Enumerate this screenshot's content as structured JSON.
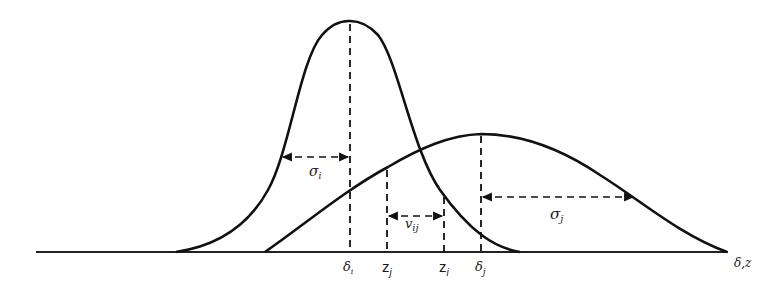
{
  "diagram": {
    "axis_label": "δ,z",
    "curves": [
      {
        "name": "distribution-i",
        "mean_label": "δ",
        "mean_subscript": "i",
        "sd_label": "σ",
        "sd_subscript": "i"
      },
      {
        "name": "distribution-j",
        "mean_label": "δ",
        "mean_subscript": "j",
        "sd_label": "σ",
        "sd_subscript": "j"
      }
    ],
    "tick_labels": [
      {
        "base": "δ",
        "sub": "i"
      },
      {
        "base": "z",
        "sub": "j"
      },
      {
        "base": "z",
        "sub": "i"
      },
      {
        "base": "δ",
        "sub": "j"
      }
    ],
    "annotations": {
      "sigma_i": {
        "base": "σ",
        "sub": "i"
      },
      "sigma_j": {
        "base": "σ",
        "sub": "j"
      },
      "v_ij": {
        "base": "v",
        "sub": "ij"
      }
    },
    "colors": {
      "ink": "#111111",
      "background": "#ffffff"
    }
  }
}
